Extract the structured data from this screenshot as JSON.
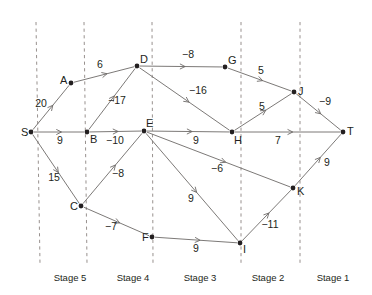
{
  "figure": {
    "type": "network-diagram",
    "width": 372,
    "height": 295,
    "background_color": "#ffffff",
    "edge_color": "#6d6a68",
    "node_color": "#231f20",
    "divider_color": "#8c8481"
  },
  "chart_data": {
    "type": "diagram",
    "nodes": [
      {
        "id": "S",
        "label": "S",
        "x": 31,
        "y": 132,
        "label_dx": -10,
        "label_dy": 4,
        "stage": "source"
      },
      {
        "id": "A",
        "label": "A",
        "x": 71,
        "y": 83,
        "label_dx": -11,
        "label_dy": 1,
        "stage": "Stage 5"
      },
      {
        "id": "B",
        "label": "B",
        "x": 87,
        "y": 132,
        "label_dx": 3,
        "label_dy": 11,
        "stage": "Stage 5"
      },
      {
        "id": "C",
        "label": "C",
        "x": 81,
        "y": 206,
        "label_dx": -11,
        "label_dy": 4,
        "stage": "Stage 5"
      },
      {
        "id": "D",
        "label": "D",
        "x": 137,
        "y": 66,
        "label_dx": 3,
        "label_dy": -3,
        "stage": "Stage 4"
      },
      {
        "id": "E",
        "label": "E",
        "x": 144,
        "y": 131,
        "label_dx": 2,
        "label_dy": -4,
        "stage": "Stage 4"
      },
      {
        "id": "F",
        "label": "F",
        "x": 152,
        "y": 237,
        "label_dx": -10,
        "label_dy": 4,
        "stage": "Stage 4"
      },
      {
        "id": "G",
        "label": "G",
        "x": 225,
        "y": 67,
        "label_dx": 3,
        "label_dy": -3,
        "stage": "Stage 3"
      },
      {
        "id": "H",
        "label": "H",
        "x": 232,
        "y": 132,
        "label_dx": 2,
        "label_dy": 12,
        "stage": "Stage 3"
      },
      {
        "id": "I",
        "label": "I",
        "x": 240,
        "y": 243,
        "label_dx": 3,
        "label_dy": 10,
        "stage": "Stage 3"
      },
      {
        "id": "J",
        "label": "J",
        "x": 294,
        "y": 92,
        "label_dx": 4,
        "label_dy": 3,
        "stage": "Stage 2"
      },
      {
        "id": "K",
        "label": "K",
        "x": 293,
        "y": 188,
        "label_dx": 4,
        "label_dy": 7,
        "stage": "Stage 2"
      },
      {
        "id": "T",
        "label": "T",
        "x": 343,
        "y": 132,
        "label_dx": 4,
        "label_dy": 3,
        "stage": "sink"
      }
    ],
    "edges": [
      {
        "from": "S",
        "to": "A",
        "weight": "20",
        "label_x": 41,
        "label_y": 107
      },
      {
        "from": "S",
        "to": "B",
        "weight": "9",
        "label_x": 60,
        "label_y": 144
      },
      {
        "from": "S",
        "to": "C",
        "weight": "15",
        "label_x": 54,
        "label_y": 181
      },
      {
        "from": "A",
        "to": "D",
        "weight": "6",
        "label_x": 100,
        "label_y": 68
      },
      {
        "from": "B",
        "to": "D",
        "weight": "−17",
        "label_x": 117,
        "label_y": 104
      },
      {
        "from": "B",
        "to": "E",
        "weight": "−10",
        "label_x": 115,
        "label_y": 144
      },
      {
        "from": "C",
        "to": "E",
        "weight": "−8",
        "label_x": 118,
        "label_y": 177
      },
      {
        "from": "C",
        "to": "F",
        "weight": "−7",
        "label_x": 111,
        "label_y": 230
      },
      {
        "from": "D",
        "to": "G",
        "weight": "−8",
        "label_x": 188,
        "label_y": 58
      },
      {
        "from": "D",
        "to": "H",
        "weight": "−16",
        "label_x": 198,
        "label_y": 94
      },
      {
        "from": "E",
        "to": "H",
        "weight": "9",
        "label_x": 196,
        "label_y": 144
      },
      {
        "from": "E",
        "to": "I",
        "weight": "9",
        "label_x": 191,
        "label_y": 202
      },
      {
        "from": "E",
        "to": "K",
        "weight": "−6",
        "label_x": 217,
        "label_y": 172
      },
      {
        "from": "F",
        "to": "I",
        "weight": "9",
        "label_x": 196,
        "label_y": 252
      },
      {
        "from": "G",
        "to": "J",
        "weight": "5",
        "label_x": 261,
        "label_y": 74
      },
      {
        "from": "H",
        "to": "J",
        "weight": "5",
        "label_x": 262,
        "label_y": 110
      },
      {
        "from": "H",
        "to": "T",
        "weight": "7",
        "label_x": 278,
        "label_y": 144
      },
      {
        "from": "I",
        "to": "K",
        "weight": "−11",
        "label_x": 270,
        "label_y": 228
      },
      {
        "from": "J",
        "to": "T",
        "weight": "−9",
        "label_x": 325,
        "label_y": 105
      },
      {
        "from": "K",
        "to": "T",
        "weight": "9",
        "label_x": 327,
        "label_y": 166
      }
    ],
    "stage_dividers": [
      {
        "x_top": 36,
        "x_bottom": 40,
        "y_top": 22,
        "y_bottom": 264
      },
      {
        "x_top": 84,
        "x_bottom": 87,
        "y_top": 22,
        "y_bottom": 264
      },
      {
        "x_top": 152,
        "x_bottom": 153,
        "y_top": 22,
        "y_bottom": 264
      },
      {
        "x_top": 241,
        "x_bottom": 241,
        "y_top": 22,
        "y_bottom": 264
      },
      {
        "x_top": 300,
        "x_bottom": 300,
        "y_top": 22,
        "y_bottom": 264
      }
    ],
    "stage_labels": [
      {
        "text": "Stage 5",
        "x": 70,
        "y": 281
      },
      {
        "text": "Stage 4",
        "x": 133,
        "y": 281
      },
      {
        "text": "Stage 3",
        "x": 200,
        "y": 281
      },
      {
        "text": "Stage 2",
        "x": 268,
        "y": 281
      },
      {
        "text": "Stage 1",
        "x": 333,
        "y": 281
      }
    ]
  }
}
